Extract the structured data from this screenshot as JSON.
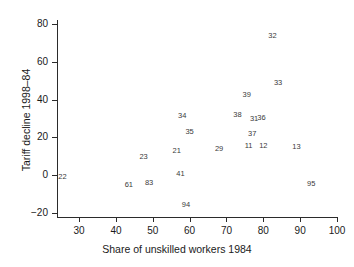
{
  "chart_data": {
    "type": "scatter",
    "title": "",
    "xlabel": "Share of unskilled workers 1984",
    "ylabel": "Tariff decline 1998–84",
    "xlim": [
      24,
      100
    ],
    "ylim": [
      -22,
      82
    ],
    "xticks": [
      30,
      40,
      50,
      60,
      70,
      80,
      90,
      100
    ],
    "yticks": [
      -20,
      0,
      20,
      40,
      60,
      80
    ],
    "xtick_labels": [
      "30",
      "40",
      "50",
      "60",
      "70",
      "80",
      "90",
      "100"
    ],
    "ytick_labels": [
      "−20",
      "0",
      "20",
      "40",
      "60",
      "80"
    ],
    "grid": false,
    "legend": null,
    "point_style": "numeric-label",
    "points": [
      {
        "label": "22",
        "x": 25.5,
        "y": -1.0
      },
      {
        "label": "61",
        "x": 43.5,
        "y": -5.0
      },
      {
        "label": "23",
        "x": 47.5,
        "y": 9.5
      },
      {
        "label": "83",
        "x": 49.0,
        "y": -4.0
      },
      {
        "label": "21",
        "x": 56.5,
        "y": 13.0
      },
      {
        "label": "41",
        "x": 57.5,
        "y": 0.5
      },
      {
        "label": "34",
        "x": 58.0,
        "y": 31.5
      },
      {
        "label": "35",
        "x": 60.0,
        "y": 23.0
      },
      {
        "label": "94",
        "x": 59.0,
        "y": -15.5
      },
      {
        "label": "29",
        "x": 68.0,
        "y": 14.0
      },
      {
        "label": "38",
        "x": 73.0,
        "y": 32.0
      },
      {
        "label": "11",
        "x": 76.0,
        "y": 15.5
      },
      {
        "label": "37",
        "x": 77.0,
        "y": 22.0
      },
      {
        "label": "31",
        "x": 77.5,
        "y": 29.5
      },
      {
        "label": "39",
        "x": 75.5,
        "y": 42.5
      },
      {
        "label": "36",
        "x": 79.5,
        "y": 30.5
      },
      {
        "label": "12",
        "x": 80.0,
        "y": 15.5
      },
      {
        "label": "32",
        "x": 82.5,
        "y": 73.5
      },
      {
        "label": "33",
        "x": 84.0,
        "y": 48.5
      },
      {
        "label": "13",
        "x": 89.0,
        "y": 15.0
      },
      {
        "label": "95",
        "x": 93.0,
        "y": -4.5
      }
    ]
  }
}
